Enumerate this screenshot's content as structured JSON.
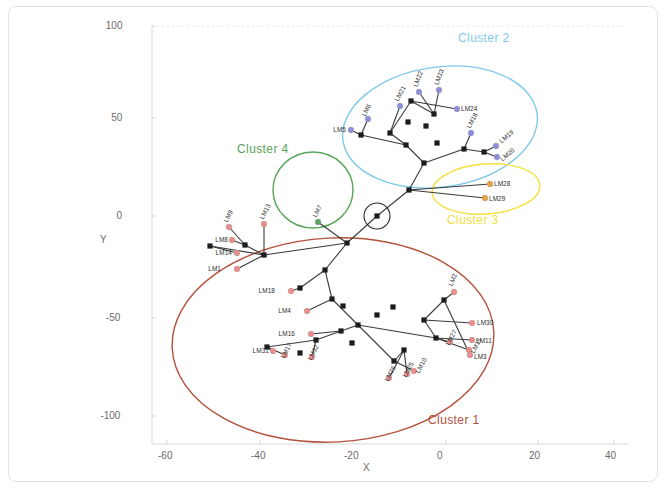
{
  "figure": {
    "axes": {
      "xlabel": "X",
      "ylabel": "Y",
      "xticks": [
        "-60",
        "-40",
        "-20",
        "0",
        "20",
        "40"
      ],
      "yticks": [
        "100",
        "50",
        "0",
        "-50",
        "-100"
      ],
      "xlim": [
        -68,
        48
      ],
      "ylim": [
        -118,
        100
      ]
    },
    "clusters": [
      {
        "id": "cluster-1",
        "label": "Cluster 1",
        "color": "#b5503c",
        "shape": "ellipse",
        "cx": 333,
        "cy": 340,
        "rx": 161,
        "ry": 102,
        "rot": -3,
        "label_x": 428,
        "label_y": 413
      },
      {
        "id": "cluster-2",
        "label": "Cluster 2",
        "color": "#7fc9e8",
        "shape": "ellipse",
        "cx": 440,
        "cy": 127,
        "rx": 98,
        "ry": 60,
        "rot": -8,
        "label_x": 458,
        "label_y": 31
      },
      {
        "id": "cluster-3",
        "label": "Cluster 3",
        "color": "#f5e03c",
        "shape": "ellipse",
        "cx": 486,
        "cy": 189,
        "rx": 54,
        "ry": 25,
        "rot": -4,
        "label_x": 447,
        "label_y": 213
      },
      {
        "id": "cluster-4",
        "label": "Cluster 4",
        "color": "#5aa55a",
        "shape": "circle",
        "cx": 313,
        "cy": 190,
        "rx": 40,
        "ry": 38,
        "rot": 0,
        "label_x": 237,
        "label_y": 142
      }
    ],
    "highlight_marker": {
      "name": "origin-node-circle",
      "cx": 377,
      "cy": 216,
      "r": 13
    },
    "landmark_colors": {
      "cluster1": "#ee8c8c",
      "cluster2": "#8e8ee0",
      "cluster3": "#e8a33c",
      "cluster4": "#5aa55a"
    },
    "landmarks": [
      {
        "id": "LM1",
        "x": 237,
        "y": 269,
        "lx": 221,
        "ly": 269,
        "rot": 0,
        "group": "cluster1",
        "anchor": "end"
      },
      {
        "id": "LM2",
        "x": 454,
        "y": 292,
        "lx": 450,
        "ly": 286,
        "rot": -68,
        "group": "cluster1",
        "anchor": "start"
      },
      {
        "id": "LM3",
        "x": 470,
        "y": 355,
        "lx": 474,
        "ly": 357,
        "rot": 0,
        "group": "cluster1",
        "anchor": "start"
      },
      {
        "id": "LM4",
        "x": 307,
        "y": 311,
        "lx": 291,
        "ly": 311,
        "rot": 0,
        "group": "cluster1",
        "anchor": "end"
      },
      {
        "id": "LM5",
        "x": 351,
        "y": 130,
        "lx": 346,
        "ly": 130,
        "rot": 0,
        "group": "cluster2",
        "anchor": "end"
      },
      {
        "id": "LM6",
        "x": 368,
        "y": 119,
        "lx": 363,
        "ly": 116,
        "rot": -62,
        "group": "cluster2",
        "anchor": "start"
      },
      {
        "id": "LM7",
        "x": 318,
        "y": 222,
        "lx": 314,
        "ly": 217,
        "rot": -62,
        "group": "cluster4",
        "anchor": "start"
      },
      {
        "id": "LM8",
        "x": 232,
        "y": 240,
        "lx": 228,
        "ly": 240,
        "rot": 0,
        "group": "cluster1",
        "anchor": "end"
      },
      {
        "id": "LM9",
        "x": 229,
        "y": 227,
        "lx": 225,
        "ly": 222,
        "rot": -62,
        "group": "cluster1",
        "anchor": "start"
      },
      {
        "id": "LM10",
        "x": 414,
        "y": 371,
        "lx": 417,
        "ly": 373,
        "rot": -62,
        "group": "cluster1",
        "anchor": "start"
      },
      {
        "id": "LM11",
        "x": 472,
        "y": 340,
        "lx": 476,
        "ly": 341,
        "rot": 0,
        "group": "cluster1",
        "anchor": "start"
      },
      {
        "id": "LM13",
        "x": 264,
        "y": 224,
        "lx": 261,
        "ly": 219,
        "rot": -62,
        "group": "cluster1",
        "anchor": "start"
      },
      {
        "id": "LM14",
        "x": 237,
        "y": 253,
        "lx": 232,
        "ly": 253,
        "rot": 0,
        "group": "cluster1",
        "anchor": "end"
      },
      {
        "id": "LM15",
        "x": 469,
        "y": 350,
        "lx": 472,
        "ly": 353,
        "rot": -62,
        "group": "cluster1",
        "anchor": "start"
      },
      {
        "id": "LM16",
        "x": 311,
        "y": 334,
        "lx": 295,
        "ly": 334,
        "rot": 0,
        "group": "cluster1",
        "anchor": "end"
      },
      {
        "id": "LM17",
        "x": 285,
        "y": 355,
        "lx": 282,
        "ly": 358,
        "rot": -62,
        "group": "cluster1",
        "anchor": "start"
      },
      {
        "id": "LM18",
        "x": 291,
        "y": 291,
        "lx": 275,
        "ly": 291,
        "rot": 0,
        "group": "cluster1",
        "anchor": "end"
      },
      {
        "id": "LM19",
        "x": 496,
        "y": 146,
        "lx": 500,
        "ly": 142,
        "rot": -40,
        "group": "cluster2",
        "anchor": "start"
      },
      {
        "id": "LM20",
        "x": 497,
        "y": 157,
        "lx": 501,
        "ly": 160,
        "rot": -40,
        "group": "cluster2",
        "anchor": "start"
      },
      {
        "id": "LM21",
        "x": 400,
        "y": 106,
        "lx": 396,
        "ly": 101,
        "rot": -62,
        "group": "cluster2",
        "anchor": "start"
      },
      {
        "id": "LM22",
        "x": 419,
        "y": 92,
        "lx": 415,
        "ly": 87,
        "rot": -70,
        "group": "cluster2",
        "anchor": "start"
      },
      {
        "id": "LM23",
        "x": 439,
        "y": 90,
        "lx": 436,
        "ly": 85,
        "rot": -70,
        "group": "cluster2",
        "anchor": "start"
      },
      {
        "id": "LM24",
        "x": 457,
        "y": 109,
        "lx": 461,
        "ly": 109,
        "rot": 0,
        "group": "cluster2",
        "anchor": "start"
      },
      {
        "id": "LM25",
        "x": 407,
        "y": 374,
        "lx": 404,
        "ly": 377,
        "rot": -62,
        "group": "cluster1",
        "anchor": "start"
      },
      {
        "id": "LM26",
        "x": 389,
        "y": 378,
        "lx": 386,
        "ly": 381,
        "rot": -62,
        "group": "cluster1",
        "anchor": "start"
      },
      {
        "id": "LM27",
        "x": 450,
        "y": 342,
        "lx": 447,
        "ly": 345,
        "rot": -62,
        "group": "cluster1",
        "anchor": "start"
      },
      {
        "id": "LM28",
        "x": 490,
        "y": 184,
        "lx": 494,
        "ly": 184,
        "rot": 0,
        "group": "cluster3",
        "anchor": "start"
      },
      {
        "id": "LM29",
        "x": 485,
        "y": 198,
        "lx": 489,
        "ly": 199,
        "rot": 0,
        "group": "cluster3",
        "anchor": "start"
      },
      {
        "id": "LM30",
        "x": 472,
        "y": 323,
        "lx": 477,
        "ly": 323,
        "rot": 0,
        "group": "cluster1",
        "anchor": "start"
      },
      {
        "id": "LM31",
        "x": 273,
        "y": 351,
        "lx": 269,
        "ly": 351,
        "rot": 0,
        "group": "cluster1",
        "anchor": "end"
      },
      {
        "id": "LM32",
        "x": 312,
        "y": 357,
        "lx": 309,
        "ly": 360,
        "rot": -62,
        "group": "cluster1",
        "anchor": "start"
      },
      {
        "id": "LM18b",
        "x": 471,
        "y": 133,
        "lx": 468,
        "ly": 128,
        "rot": -62,
        "group": "cluster2",
        "anchor": "start",
        "text": "LM18"
      }
    ],
    "tree_nodes": [
      [
        377,
        216
      ],
      [
        347,
        243
      ],
      [
        325,
        270
      ],
      [
        300,
        288
      ],
      [
        343,
        306
      ],
      [
        358,
        325
      ],
      [
        377,
        315
      ],
      [
        393,
        307
      ],
      [
        406,
        145
      ],
      [
        424,
        163
      ],
      [
        409,
        190
      ],
      [
        437,
        143
      ],
      [
        426,
        126
      ],
      [
        408,
        122
      ],
      [
        390,
        133
      ],
      [
        361,
        135
      ],
      [
        434,
        114
      ],
      [
        411,
        101
      ],
      [
        464,
        149
      ],
      [
        484,
        152
      ],
      [
        341,
        331
      ],
      [
        352,
        343
      ],
      [
        316,
        340
      ],
      [
        267,
        347
      ],
      [
        300,
        353
      ],
      [
        394,
        361
      ],
      [
        404,
        350
      ],
      [
        436,
        338
      ],
      [
        424,
        320
      ],
      [
        444,
        300
      ],
      [
        264,
        255
      ],
      [
        245,
        245
      ],
      [
        210,
        246
      ],
      [
        332,
        299
      ]
    ],
    "tree_edges": [
      [
        [
          377,
          216
        ],
        [
          347,
          243
        ]
      ],
      [
        [
          347,
          243
        ],
        [
          325,
          270
        ]
      ],
      [
        [
          347,
          243
        ],
        [
          264,
          255
        ]
      ],
      [
        [
          264,
          255
        ],
        [
          245,
          245
        ]
      ],
      [
        [
          264,
          255
        ],
        [
          210,
          246
        ]
      ],
      [
        [
          264,
          255
        ],
        [
          237,
          269
        ]
      ],
      [
        [
          245,
          245
        ],
        [
          229,
          227
        ]
      ],
      [
        [
          245,
          245
        ],
        [
          232,
          240
        ]
      ],
      [
        [
          210,
          246
        ],
        [
          237,
          253
        ]
      ],
      [
        [
          264,
          255
        ],
        [
          264,
          224
        ]
      ],
      [
        [
          325,
          270
        ],
        [
          300,
          288
        ]
      ],
      [
        [
          300,
          288
        ],
        [
          291,
          291
        ]
      ],
      [
        [
          325,
          270
        ],
        [
          332,
          299
        ]
      ],
      [
        [
          332,
          299
        ],
        [
          307,
          311
        ]
      ],
      [
        [
          332,
          299
        ],
        [
          358,
          325
        ]
      ],
      [
        [
          358,
          325
        ],
        [
          341,
          331
        ]
      ],
      [
        [
          341,
          331
        ],
        [
          311,
          334
        ]
      ],
      [
        [
          341,
          331
        ],
        [
          316,
          340
        ]
      ],
      [
        [
          316,
          340
        ],
        [
          267,
          347
        ]
      ],
      [
        [
          267,
          347
        ],
        [
          273,
          351
        ]
      ],
      [
        [
          267,
          347
        ],
        [
          285,
          355
        ]
      ],
      [
        [
          316,
          340
        ],
        [
          312,
          357
        ]
      ],
      [
        [
          358,
          325
        ],
        [
          394,
          361
        ]
      ],
      [
        [
          394,
          361
        ],
        [
          404,
          350
        ]
      ],
      [
        [
          404,
          350
        ],
        [
          389,
          378
        ]
      ],
      [
        [
          404,
          350
        ],
        [
          407,
          374
        ]
      ],
      [
        [
          394,
          361
        ],
        [
          414,
          371
        ]
      ],
      [
        [
          358,
          325
        ],
        [
          436,
          338
        ]
      ],
      [
        [
          436,
          338
        ],
        [
          424,
          320
        ]
      ],
      [
        [
          424,
          320
        ],
        [
          444,
          300
        ]
      ],
      [
        [
          444,
          300
        ],
        [
          454,
          292
        ]
      ],
      [
        [
          444,
          300
        ],
        [
          470,
          355
        ]
      ],
      [
        [
          424,
          320
        ],
        [
          472,
          323
        ]
      ],
      [
        [
          436,
          338
        ],
        [
          472,
          340
        ]
      ],
      [
        [
          436,
          338
        ],
        [
          469,
          350
        ]
      ],
      [
        [
          436,
          338
        ],
        [
          450,
          342
        ]
      ],
      [
        [
          377,
          216
        ],
        [
          409,
          190
        ]
      ],
      [
        [
          409,
          190
        ],
        [
          424,
          163
        ]
      ],
      [
        [
          424,
          163
        ],
        [
          406,
          145
        ]
      ],
      [
        [
          406,
          145
        ],
        [
          361,
          135
        ]
      ],
      [
        [
          361,
          135
        ],
        [
          351,
          130
        ]
      ],
      [
        [
          361,
          135
        ],
        [
          368,
          119
        ]
      ],
      [
        [
          406,
          145
        ],
        [
          390,
          133
        ]
      ],
      [
        [
          390,
          133
        ],
        [
          400,
          106
        ]
      ],
      [
        [
          390,
          133
        ],
        [
          411,
          101
        ]
      ],
      [
        [
          411,
          101
        ],
        [
          434,
          114
        ]
      ],
      [
        [
          434,
          114
        ],
        [
          419,
          92
        ]
      ],
      [
        [
          434,
          114
        ],
        [
          439,
          90
        ]
      ],
      [
        [
          411,
          101
        ],
        [
          457,
          109
        ]
      ],
      [
        [
          424,
          163
        ],
        [
          464,
          149
        ]
      ],
      [
        [
          464,
          149
        ],
        [
          484,
          152
        ]
      ],
      [
        [
          484,
          152
        ],
        [
          496,
          146
        ]
      ],
      [
        [
          484,
          152
        ],
        [
          497,
          157
        ]
      ],
      [
        [
          464,
          149
        ],
        [
          471,
          133
        ]
      ],
      [
        [
          409,
          190
        ],
        [
          490,
          184
        ]
      ],
      [
        [
          409,
          190
        ],
        [
          485,
          198
        ]
      ],
      [
        [
          347,
          243
        ],
        [
          318,
          222
        ]
      ]
    ]
  }
}
